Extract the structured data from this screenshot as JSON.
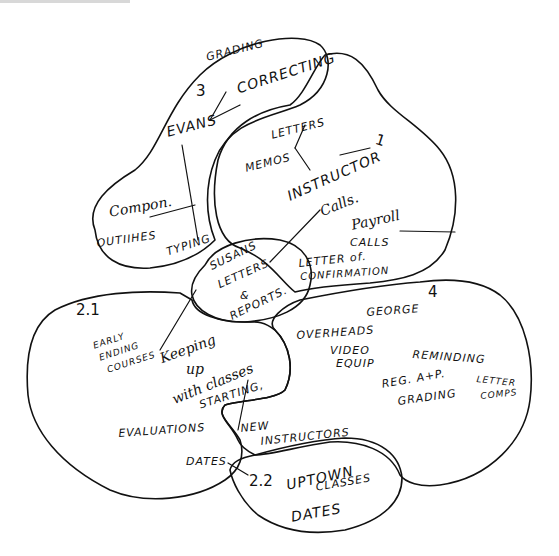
{
  "diagram": {
    "title": "",
    "colors": {
      "ink": "#111111",
      "paper": "#ffffff"
    },
    "groups": [
      {
        "id": "3",
        "label": "3",
        "items": [
          "GRADING",
          "EVANS",
          "CORRECTING",
          "Compon. outlines",
          "TYPING"
        ]
      },
      {
        "id": "1",
        "label": "1",
        "items": [
          "LETTERS",
          "MEMOS",
          "INSTRUCTOR CALLS.",
          "Payroll CALLS",
          "LETTER of CONFIRMATION"
        ]
      },
      {
        "id": "center",
        "label": "",
        "items": [
          "SUSANS LETTERS & REPORTS."
        ]
      },
      {
        "id": "2.1",
        "label": "2.1",
        "items": [
          "EARLY ENDING COURSES",
          "Keeping up with classes STARTING,",
          "EVALUATIONS",
          "DATES",
          "NEW INSTRUCTORS"
        ]
      },
      {
        "id": "4",
        "label": "4",
        "items": [
          "GEORGE",
          "OVERHEADS VIDEO EQUIP",
          "REMINDING",
          "REG. A+P. GRADING",
          "LETTER COMPS"
        ]
      },
      {
        "id": "2.2",
        "label": "2.2",
        "items": [
          "UPTOWN CLASSES",
          "DATES"
        ]
      }
    ],
    "labels": {
      "g3_num": "3",
      "grading": "GRADING",
      "correcting": "CORRECTING",
      "evans": "EVANS",
      "compon": "Compon.",
      "outlines": "OUTIIHES",
      "typing": "TYPING",
      "letters": "LETTERS",
      "memos": "MEMOS",
      "g1_num": "1",
      "instructor": "INSTRUCTOR",
      "calls": "Calls.",
      "payroll": "Payroll",
      "payroll_calls": "CALLS",
      "letter_of": "LETTER of.",
      "confirmation": "CONFIRMATION",
      "susans": "SUSANS",
      "susans_letters": "LETTERS",
      "amp": "&",
      "reports": "REPORTS.",
      "g21_num": "2.1",
      "early": "EARLY",
      "ending": "ENDING",
      "courses": "COURSES",
      "keeping": "Keeping",
      "up": "up",
      "with_classes": "with classes",
      "starting": "STARTING,",
      "evaluations": "EVALUATIONS",
      "dates1": "DATES",
      "new": "NEW",
      "instructors": "INSTRUCTORS",
      "g4_num": "4",
      "george": "GEORGE",
      "overheads": "OVERHEADS",
      "video": "VIDEO",
      "equip": "EQUIP",
      "reminding": "REMINDING",
      "reg": "REG. A+P.",
      "reg_grading": "GRADING",
      "letter": "LETTER",
      "comps": "COMPS",
      "g22_num": "2.2",
      "uptown": "UPTOWN",
      "classes": "CLASSES",
      "dates2": "DATES"
    }
  }
}
